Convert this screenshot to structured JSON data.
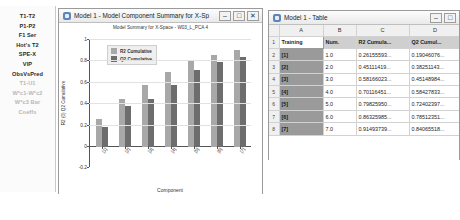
{
  "sidebar": {
    "items": [
      {
        "label": "T1-T2",
        "dim": false
      },
      {
        "label": "P1-P2",
        "dim": false
      },
      {
        "label": "F1 Ser",
        "dim": false
      },
      {
        "label": "Hot's T2",
        "dim": false
      },
      {
        "label": "SPE-X",
        "dim": false
      },
      {
        "label": "VIP",
        "dim": false
      },
      {
        "label": "ObsVsPred",
        "dim": false
      },
      {
        "label": "T1-U1",
        "dim": true
      },
      {
        "label": "W*c1-W*c2",
        "dim": true
      },
      {
        "label": "W*c3 Bar",
        "dim": true
      },
      {
        "label": "Coeffs",
        "dim": true
      }
    ]
  },
  "chart_window": {
    "title": "Model 1 - Model Component Summary for X-Sp",
    "icon": "app-icon",
    "buttons": [
      {
        "name": "minimize",
        "glyph": "–"
      },
      {
        "name": "maximize",
        "glyph": "□"
      },
      {
        "name": "close",
        "glyph": "✕"
      }
    ]
  },
  "table_window": {
    "title": "Model 1 - Table",
    "icon": "app-icon",
    "buttons": [
      {
        "name": "minimize",
        "glyph": "–"
      },
      {
        "name": "maximize",
        "glyph": "□"
      }
    ],
    "column_headers": [
      "A",
      "B",
      "C",
      "D"
    ],
    "header_row": [
      "Training",
      "Num.",
      "R2 Cumula...",
      "Q2 Cumul..."
    ],
    "row_numbers": [
      "1",
      "2",
      "3",
      "4",
      "5",
      "6",
      "7",
      "8"
    ],
    "rows": [
      {
        "label": "[1]",
        "num": "1.0",
        "r2": "0.26155593...",
        "q2": "0.19046076..."
      },
      {
        "label": "[2]",
        "num": "2.0",
        "r2": "0.45111419...",
        "q2": "0.38251143..."
      },
      {
        "label": "[3]",
        "num": "3.0",
        "r2": "0.58166023...",
        "q2": "0.45148984..."
      },
      {
        "label": "[4]",
        "num": "4.0",
        "r2": "0.70116451...",
        "q2": "0.58427833..."
      },
      {
        "label": "[5]",
        "num": "5.0",
        "r2": "0.79825950...",
        "q2": "0.72402397..."
      },
      {
        "label": "[6]",
        "num": "6.0",
        "r2": "0.86325985...",
        "q2": "0.78512351..."
      },
      {
        "label": "[7]",
        "num": "7.0",
        "r2": "0.91493739...",
        "q2": "0.84065518..."
      }
    ]
  },
  "chart_data": {
    "type": "bar",
    "title": "Model Summary for X-Space - W03_L_PCA 4",
    "xlabel": "Component",
    "ylabel": "R2 (0) Q2 Cumulative",
    "categories": [
      "[1]",
      "[2]",
      "[3]",
      "[4]",
      "[5]",
      "[6]",
      "[7]"
    ],
    "series": [
      {
        "name": "R2 Cumulative",
        "color": "#a8a8a8",
        "values": [
          0.26,
          0.45,
          0.58,
          0.7,
          0.8,
          0.86,
          0.91
        ]
      },
      {
        "name": "Q2 Cumulative",
        "color": "#6d6d6d",
        "values": [
          0.19,
          0.38,
          0.45,
          0.58,
          0.72,
          0.79,
          0.84
        ]
      }
    ],
    "ylim": [
      -0.2,
      1.0
    ],
    "yticks": [
      "1",
      "0.8",
      "0.6",
      "0.4",
      "0.2",
      "0",
      "-0.2"
    ],
    "grid": true,
    "legend_position": "top-left"
  },
  "caption": ""
}
